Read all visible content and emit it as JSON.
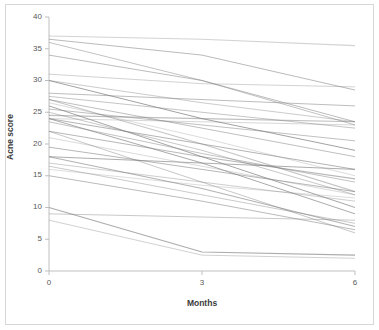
{
  "chart_data": {
    "type": "line",
    "title": "",
    "subtitle": "",
    "xlabel": "Months",
    "ylabel": "Acne score",
    "x": [
      0,
      3,
      6
    ],
    "xlim": [
      0,
      6
    ],
    "ylim": [
      0,
      40
    ],
    "xticks": [
      "0",
      "3",
      "6"
    ],
    "yticks": [
      "0",
      "5",
      "10",
      "15",
      "20",
      "25",
      "30",
      "35",
      "40"
    ],
    "grid": false,
    "legend": "none",
    "line_color": "#808080",
    "series_note": "individual subject trajectories (spaghetti plot)",
    "series": [
      {
        "name": "subject-1",
        "values": [
          37,
          36.5,
          35.5
        ]
      },
      {
        "name": "subject-2",
        "values": [
          36.5,
          34,
          28.5
        ]
      },
      {
        "name": "subject-3",
        "values": [
          36,
          30,
          23
        ]
      },
      {
        "name": "subject-4",
        "values": [
          34,
          30,
          23.5
        ]
      },
      {
        "name": "subject-5",
        "values": [
          31,
          29.5,
          29
        ]
      },
      {
        "name": "subject-6",
        "values": [
          30,
          26.5,
          23.5
        ]
      },
      {
        "name": "subject-7",
        "values": [
          30,
          24,
          19
        ]
      },
      {
        "name": "subject-8",
        "values": [
          28,
          27,
          26
        ]
      },
      {
        "name": "subject-9",
        "values": [
          27.5,
          25,
          22.5
        ]
      },
      {
        "name": "subject-10",
        "values": [
          27,
          22.5,
          18
        ]
      },
      {
        "name": "subject-11",
        "values": [
          27,
          20,
          12.5
        ]
      },
      {
        "name": "subject-12",
        "values": [
          26.5,
          21,
          15
        ]
      },
      {
        "name": "subject-13",
        "values": [
          26,
          18,
          10
        ]
      },
      {
        "name": "subject-14",
        "values": [
          25.5,
          23,
          20.5
        ]
      },
      {
        "name": "subject-15",
        "values": [
          25,
          19,
          12
        ]
      },
      {
        "name": "subject-16",
        "values": [
          24.5,
          24,
          23.5
        ]
      },
      {
        "name": "subject-17",
        "values": [
          24,
          23.5,
          23
        ]
      },
      {
        "name": "subject-18",
        "values": [
          24,
          20,
          16
        ]
      },
      {
        "name": "subject-19",
        "values": [
          24,
          17,
          9
        ]
      },
      {
        "name": "subject-20",
        "values": [
          23.5,
          18.5,
          14
        ]
      },
      {
        "name": "subject-21",
        "values": [
          22,
          18,
          14.5
        ]
      },
      {
        "name": "subject-22",
        "values": [
          22,
          14,
          6
        ]
      },
      {
        "name": "subject-23",
        "values": [
          21,
          16.5,
          12
        ]
      },
      {
        "name": "subject-24",
        "values": [
          19.5,
          16,
          12.5
        ]
      },
      {
        "name": "subject-25",
        "values": [
          18,
          17,
          16
        ]
      },
      {
        "name": "subject-26",
        "values": [
          18,
          13,
          7
        ]
      },
      {
        "name": "subject-27",
        "values": [
          17,
          14,
          11
        ]
      },
      {
        "name": "subject-28",
        "values": [
          16.5,
          12,
          7.5
        ]
      },
      {
        "name": "subject-29",
        "values": [
          16,
          13.5,
          11.5
        ]
      },
      {
        "name": "subject-30",
        "values": [
          15,
          11,
          6.5
        ]
      },
      {
        "name": "subject-31",
        "values": [
          10,
          3,
          2.5
        ]
      },
      {
        "name": "subject-32",
        "values": [
          9,
          8.5,
          8
        ]
      },
      {
        "name": "subject-33",
        "values": [
          8,
          2.5,
          2
        ]
      }
    ]
  },
  "axes": {
    "y_title": "Acne score",
    "x_title": "Months"
  }
}
